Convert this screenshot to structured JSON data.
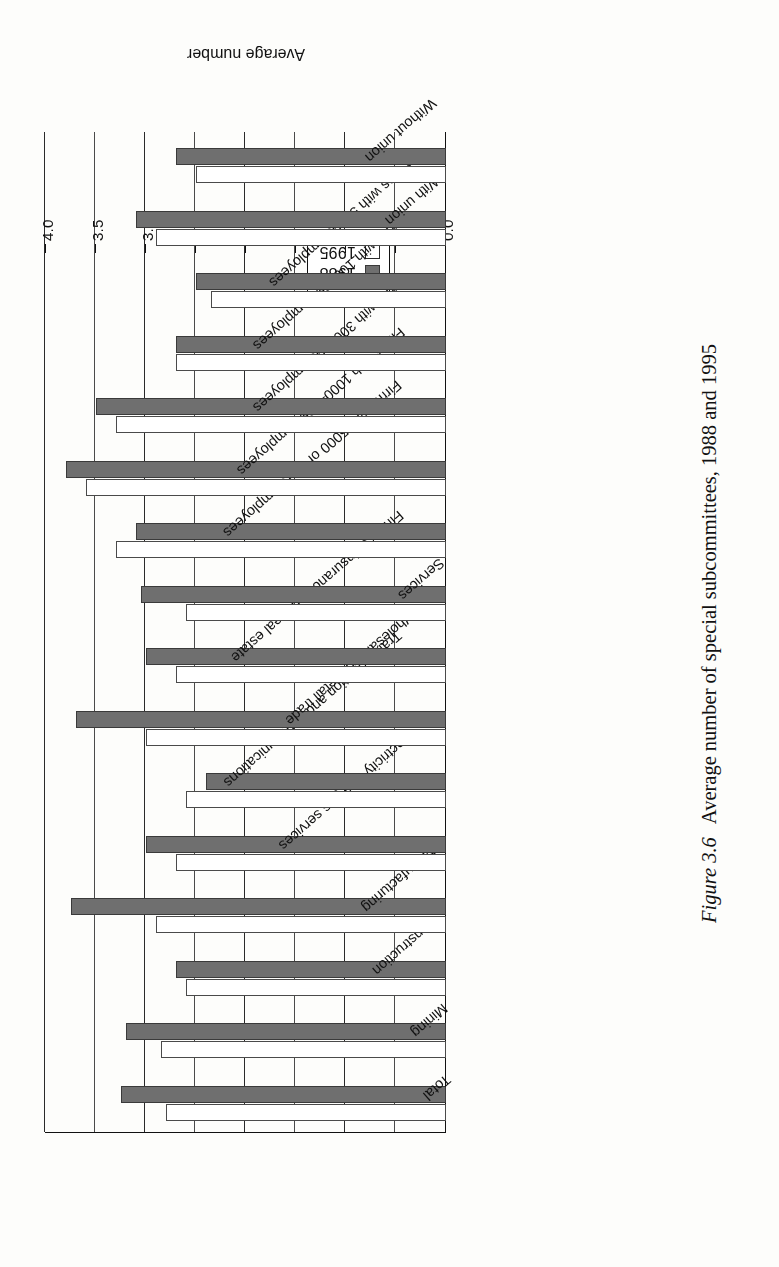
{
  "caption": {
    "figure_number": "Figure 3.6",
    "text": "Average number of special subcommittees, 1988 and 1995"
  },
  "legend": {
    "entries": [
      {
        "label": "1988",
        "color": "#6f6f6f",
        "style": "filled"
      },
      {
        "label": "1995",
        "color": "#ffffff",
        "style": "open"
      }
    ]
  },
  "axis": {
    "value_axis_title": "Average number",
    "tick_labels": [
      "0.0",
      "0.5",
      "1.0",
      "1.5",
      "2.0",
      "2.5",
      "3.0",
      "3.5",
      "4.0"
    ]
  },
  "chart_data": {
    "type": "bar",
    "orientation": "horizontal",
    "title": "Average number of special subcommittees, 1988 and 1995",
    "xlabel": "Average number",
    "ylabel": "",
    "xlim": [
      0.0,
      4.0
    ],
    "xticks": [
      0.0,
      0.5,
      1.0,
      1.5,
      2.0,
      2.5,
      3.0,
      3.5,
      4.0
    ],
    "grid": true,
    "legend_position": "bottom-right",
    "categories": [
      "Total",
      "Mining",
      "Construction",
      "Manufacturing",
      "Electricity and gas services",
      "Transportation and communications",
      "Wholesale and retail trade",
      "Finance, insurance and real estate",
      "Services",
      "Firms with 5000 or more employees",
      "Firms with 1000–4999 employees",
      "Firms with 300–999 employees",
      "Firms with 100–299 employees",
      "Firms with 50–99 employees",
      "With union",
      "Without union"
    ],
    "series": [
      {
        "name": "1988",
        "color": "#6f6f6f",
        "values": [
          3.25,
          3.2,
          2.7,
          3.75,
          3.0,
          2.4,
          3.7,
          3.0,
          3.05,
          3.1,
          3.8,
          3.5,
          2.7,
          2.5,
          3.1,
          2.7
        ]
      },
      {
        "name": "1995",
        "color": "#ffffff",
        "values": [
          2.8,
          2.85,
          2.6,
          2.9,
          2.7,
          2.6,
          3.0,
          2.7,
          2.6,
          3.3,
          3.6,
          3.3,
          2.7,
          2.35,
          2.9,
          2.5
        ]
      }
    ]
  }
}
